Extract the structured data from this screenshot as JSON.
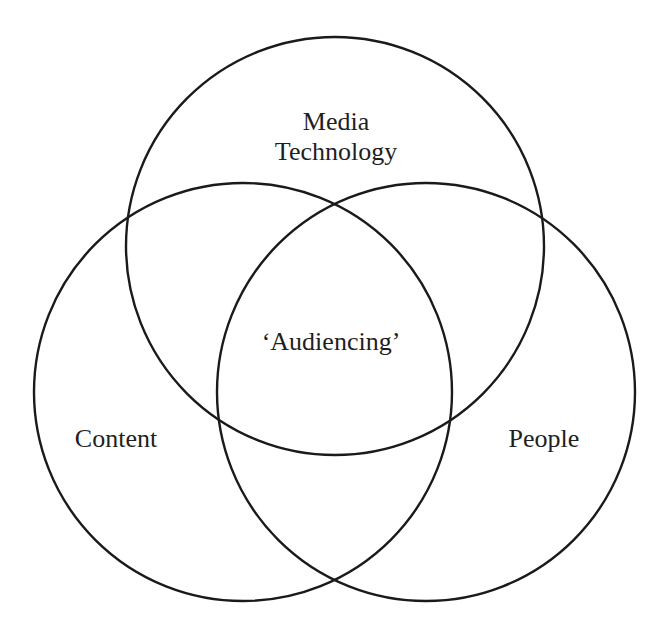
{
  "diagram": {
    "type": "venn",
    "circles": [
      {
        "name": "media-technology",
        "label_lines": [
          "Media",
          "Technology"
        ],
        "cx": 335,
        "cy": 246,
        "r": 209
      },
      {
        "name": "content",
        "label": "Content",
        "cx": 243,
        "cy": 392,
        "r": 209
      },
      {
        "name": "people",
        "label": "People",
        "cx": 426,
        "cy": 392,
        "r": 209
      }
    ],
    "center_label": "‘Audiencing’",
    "stroke_color": "#1a1a1a",
    "background": "#ffffff"
  }
}
